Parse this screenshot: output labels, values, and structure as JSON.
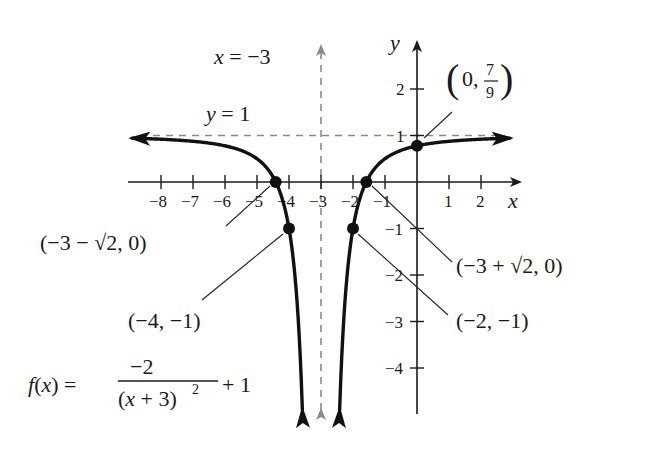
{
  "chart_data": {
    "type": "line",
    "title": "",
    "function": "f(x) = -2/(x+3)^2 + 1",
    "equation_label": {
      "lhs": "f(x) =",
      "numerator": "−2",
      "denominator": "(x + 3)",
      "exponent": "2",
      "tail": "+ 1"
    },
    "xlabel": "x",
    "ylabel": "y",
    "xlim": [
      -8.9,
      3.2
    ],
    "ylim": [
      -4.9,
      3
    ],
    "x_ticks": [
      -8,
      -7,
      -6,
      -5,
      -4,
      -3,
      -2,
      -1,
      1,
      2
    ],
    "x_tick_labels": [
      "−8",
      "−7",
      "−6",
      "−5",
      "−4",
      "−3",
      "−2",
      "−1",
      "1",
      "2"
    ],
    "y_ticks": [
      2,
      1,
      -1,
      -2,
      -3,
      -4
    ],
    "y_tick_labels": [
      "2",
      "1",
      "−1",
      "−2",
      "−3",
      "−4"
    ],
    "grid": false,
    "asymptotes": [
      {
        "type": "vertical",
        "value": -3,
        "label": "x = −3",
        "style": "dashed",
        "color": "#8a8a8a"
      },
      {
        "type": "horizontal",
        "value": 1,
        "label": "y = 1",
        "style": "dashed",
        "color": "#8a8a8a"
      }
    ],
    "points": [
      {
        "x": -4.414,
        "y": 0,
        "label": "(−3 − √2, 0)"
      },
      {
        "x": -1.586,
        "y": 0,
        "label": "(−3 + √2, 0)"
      },
      {
        "x": -4,
        "y": -1,
        "label": "(−4, −1)"
      },
      {
        "x": -2,
        "y": -1,
        "label": "(−2, −1)"
      },
      {
        "x": 0,
        "y": 0.7778,
        "label_prefix": "(0, ",
        "label_num": "7",
        "label_den": "9",
        "label_suffix": ")"
      }
    ],
    "curve_color": "#111111",
    "axis_color": "#1a1a1a"
  }
}
